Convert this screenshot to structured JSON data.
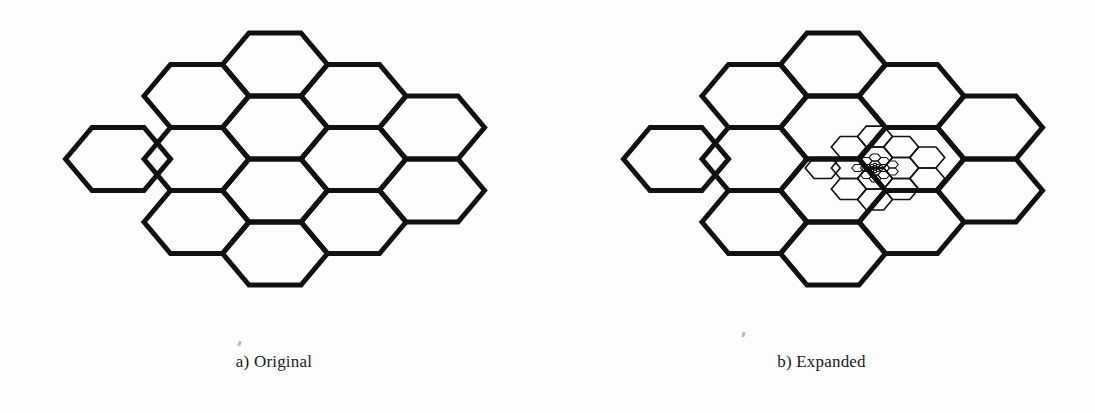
{
  "figure": {
    "type": "diagram",
    "background_color": "#fdfdfd",
    "stroke_color": "#111111",
    "stroke_width": 5,
    "panels": [
      {
        "id": "a",
        "caption": "a) Original",
        "caption_x": 274,
        "caption_y": 352,
        "recursion_depth": 1
      },
      {
        "id": "b",
        "caption": "b) Expanded",
        "caption_x": 822,
        "caption_y": 352,
        "recursion_depth": 4
      }
    ]
  },
  "geometry": {
    "hex_half_width": 52.5,
    "hex_half_height": 31.5,
    "hex_flat_half": 26.0,
    "col_step": 78.5,
    "row_step": 31.5,
    "panel_a_center": {
      "x": 275,
      "y": 159
    },
    "panel_b_center": {
      "x": 833,
      "y": 159
    },
    "nested_center": {
      "x": 875,
      "y": 168
    },
    "nested_scale": 0.333,
    "cells": [
      {
        "col": -1,
        "row": 0
      },
      {
        "col": 0,
        "row": -2
      },
      {
        "col": 0,
        "row": 0
      },
      {
        "col": 0,
        "row": 2
      },
      {
        "col": 1,
        "row": -3
      },
      {
        "col": 1,
        "row": -1
      },
      {
        "col": 1,
        "row": 1
      },
      {
        "col": 1,
        "row": 3
      },
      {
        "col": 2,
        "row": -2
      },
      {
        "col": 2,
        "row": 0
      },
      {
        "col": 2,
        "row": 2
      },
      {
        "col": 3,
        "row": -1
      },
      {
        "col": 3,
        "row": 1
      }
    ],
    "cell_count": 13
  },
  "chart_data": {
    "type": "diagram",
    "title": "",
    "categories": [
      "a) Original",
      "b) Expanded"
    ],
    "values": [
      13,
      13
    ],
    "annotations": [
      "a) Original",
      "b) Expanded"
    ]
  }
}
